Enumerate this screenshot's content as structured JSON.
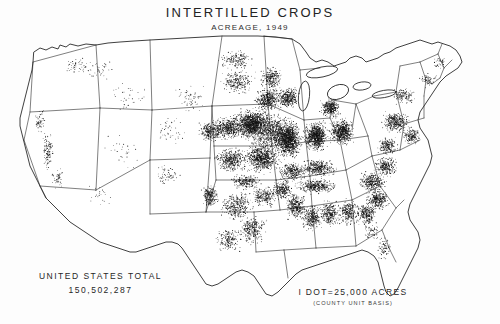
{
  "figure": {
    "name": "intertilled-crops-acreage-map",
    "kind": "dot-density-map",
    "region": "United States (contiguous 48 states)",
    "background_color": "#fdfdfd",
    "ink_color": "#1a1a1a"
  },
  "title": {
    "main": "INTERTILLED CROPS",
    "sub": "ACREAGE, 1949"
  },
  "total": {
    "label": "UNITED STATES TOTAL",
    "value": "150,502,287"
  },
  "legend": {
    "main": "I DOT=25,000 ACRES",
    "sub": "(COUNTY UNIT BASIS)",
    "dot_value_acres": 25000,
    "unit_basis": "county"
  },
  "chart_data": {
    "type": "scatter",
    "title": "INTERTILLED CROPS",
    "subtitle": "ACREAGE, 1949",
    "xlabel": "",
    "ylabel": "",
    "legend_position": "bottom-center",
    "grid": false,
    "dot_value_acres": 25000,
    "national_total_acres": 150502287,
    "density_regions": [
      {
        "name": "Corn Belt (Iowa, Illinois, Indiana, N. Missouri)",
        "relative_density": "very high"
      },
      {
        "name": "Eastern Nebraska and Kansas",
        "relative_density": "high"
      },
      {
        "name": "Ohio and Southern Michigan",
        "relative_density": "high"
      },
      {
        "name": "Southeastern Minnesota and Southern Wisconsin",
        "relative_density": "high"
      },
      {
        "name": "Kentucky, Tennessee and Mid-South",
        "relative_density": "moderate"
      },
      {
        "name": "Mississippi Delta and Gulf States",
        "relative_density": "moderate"
      },
      {
        "name": "Southern Atlantic Coastal Plain",
        "relative_density": "moderate"
      },
      {
        "name": "Pennsylvania and Mid-Atlantic",
        "relative_density": "moderate"
      },
      {
        "name": "Central and Eastern Texas",
        "relative_density": "moderate"
      },
      {
        "name": "Texas High Plains",
        "relative_density": "moderate-cluster"
      },
      {
        "name": "Dakotas",
        "relative_density": "low-moderate"
      },
      {
        "name": "New England",
        "relative_density": "low"
      },
      {
        "name": "Florida Peninsula",
        "relative_density": "low"
      },
      {
        "name": "California Central Valley",
        "relative_density": "low-linear"
      },
      {
        "name": "Intermountain West and Great Basin",
        "relative_density": "very low"
      },
      {
        "name": "Pacific Northwest interior",
        "relative_density": "very low"
      }
    ]
  }
}
